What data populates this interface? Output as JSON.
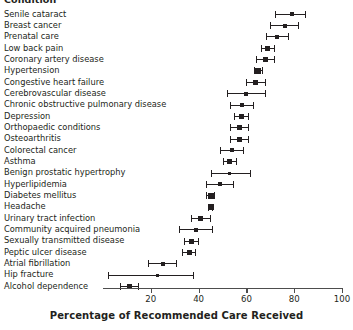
{
  "chart_data": {
    "type": "scatter",
    "title": "",
    "ylabel": "Condition",
    "xlabel": "Percentage of Recommended Care Received",
    "xlim": [
      0,
      100
    ],
    "xticks": [
      20,
      40,
      60,
      80,
      100
    ],
    "xtick_labels": [
      "20",
      "40",
      "60",
      "80",
      "100"
    ],
    "grid": false,
    "legend": null,
    "orientation": "horizontal",
    "marker_style": "square-with-error-bars",
    "categories": [
      "Senile cataract",
      "Breast cancer",
      "Prenatal care",
      "Low back pain",
      "Coronary artery disease",
      "Hypertension",
      "Congestive heart failure",
      "Cerebrovascular disease",
      "Chronic obstructive pulmonary disease",
      "Depression",
      "Orthopaedic conditions",
      "Osteoarthritis",
      "Colorectal cancer",
      "Asthma",
      "Benign prostatic hypertrophy",
      "Hyperlipidemia",
      "Diabetes mellitus",
      "Headache",
      "Urinary tract infection",
      "Community acquired pneumonia",
      "Sexually transmitted disease",
      "Peptic ulcer disease",
      "Atrial fibrillation",
      "Hip fracture",
      "Alcohol dependence"
    ],
    "values": [
      79,
      76,
      73,
      69,
      68,
      65,
      64,
      60,
      58,
      58,
      57,
      57,
      54,
      53,
      53,
      49,
      45,
      45,
      41,
      39,
      37,
      36,
      25,
      23,
      11
    ],
    "ci_low": [
      72,
      70,
      68,
      66,
      64,
      63,
      60,
      52,
      53,
      55,
      53,
      53,
      49,
      50,
      45,
      43,
      43,
      44,
      37,
      32,
      34,
      33,
      19,
      2,
      7
    ],
    "ci_high": [
      85,
      82,
      78,
      72,
      72,
      67,
      68,
      68,
      63,
      61,
      61,
      61,
      59,
      56,
      62,
      55,
      47,
      46,
      45,
      46,
      40,
      39,
      31,
      38,
      15
    ],
    "units": "percent"
  },
  "axis": {
    "y_header": "Condition",
    "x_title": "Percentage of Recommended Care Received"
  }
}
